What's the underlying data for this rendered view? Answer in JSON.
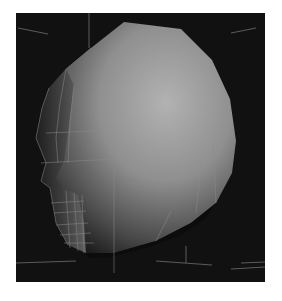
{
  "viewport": {
    "label": "3D perspective viewport",
    "background": "#111111",
    "page_background": "#ffffff",
    "model": {
      "name": "low-poly head",
      "shading": "smooth gray",
      "base_color": "#9a9a9a",
      "highlight_color": "#b4b4b4",
      "shadow_color": "#1a1a1a",
      "wireframe_color": "#8a8a8a"
    }
  }
}
